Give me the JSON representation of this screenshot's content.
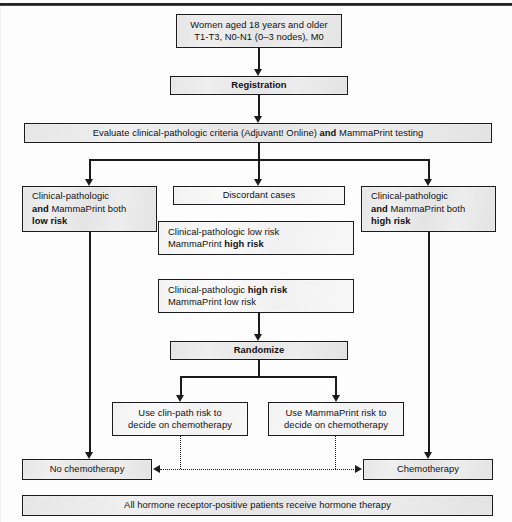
{
  "figure": {
    "accent_color": "#1b1b1d",
    "box_fill": "#e8e8e8"
  },
  "nodes": {
    "eligibility": {
      "line1": "Women aged 18 years and older",
      "line2": "T1-T3, N0-N1 (0–3 nodes), M0"
    },
    "registration": {
      "label": "Registration"
    },
    "evaluate": {
      "part1": "Evaluate clinical-pathologic criteria (Adjuvant! Online) ",
      "bold": "and",
      "part2": " MammaPrint testing"
    },
    "both_low": {
      "line1": "Clinical-pathologic",
      "line2_bold": "and",
      "line2_rest": " MammaPrint both",
      "line3_bold": "low risk"
    },
    "discordant": {
      "label": "Discordant cases"
    },
    "both_high": {
      "line1": "Clinical-pathologic",
      "line2_bold": "and",
      "line2_rest": " MammaPrint both",
      "line3_bold": "high risk"
    },
    "disc_a": {
      "line1": "Clinical-pathologic low risk",
      "line2_rest": "MammaPrint ",
      "line2_bold": "high risk"
    },
    "disc_b": {
      "line1_rest": "Clinical-pathologic ",
      "line1_bold": "high risk",
      "line2": "MammaPrint low risk"
    },
    "randomize": {
      "label": "Randomize"
    },
    "use_clinpath": {
      "line1": "Use clin-path risk to",
      "line2": "decide on chemotherapy"
    },
    "use_mammaprint": {
      "line1": "Use MammaPrint risk to",
      "line2": "decide on chemotherapy"
    },
    "no_chemo": {
      "label": "No chemotherapy"
    },
    "chemo": {
      "label": "Chemotherapy"
    },
    "hormone": {
      "label": "All hormone receptor-positive patients receive hormone therapy"
    }
  }
}
